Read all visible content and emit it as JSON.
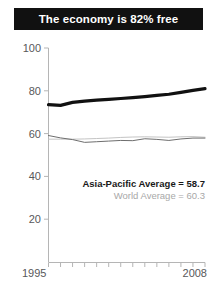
{
  "title": "The economy is 82% free",
  "chart_data": {
    "type": "line",
    "title": "The economy is 82% free",
    "xlabel": "",
    "ylabel": "",
    "xlim": [
      1995,
      2008
    ],
    "ylim": [
      0,
      100
    ],
    "yticks": [
      20,
      40,
      60,
      80,
      100
    ],
    "ytick_labels": [
      "20",
      "40",
      "60",
      "80",
      "100"
    ],
    "xticks": [
      1995,
      1996,
      1997,
      1998,
      1999,
      2000,
      2001,
      2002,
      2003,
      2004,
      2005,
      2006,
      2007,
      2008
    ],
    "xtick_labels_shown": [
      "1995",
      "2008"
    ],
    "grid": false,
    "legend": "annotation",
    "x": [
      1995,
      1996,
      1997,
      1998,
      1999,
      2000,
      2001,
      2002,
      2003,
      2004,
      2005,
      2006,
      2007,
      2008
    ],
    "series": [
      {
        "name": "Economy score",
        "color": "#111111",
        "width": 3.2,
        "values": [
          73.5,
          73.2,
          74.6,
          75.2,
          75.6,
          76.0,
          76.4,
          76.8,
          77.3,
          77.9,
          78.4,
          79.3,
          80.2,
          81.0
        ]
      },
      {
        "name": "Asia-Pacific Average",
        "color": "#6e6e6e",
        "width": 1.0,
        "values": [
          59.1,
          58.0,
          57.2,
          55.9,
          56.2,
          56.5,
          56.8,
          56.7,
          57.6,
          57.3,
          56.8,
          57.5,
          57.9,
          57.9
        ]
      },
      {
        "name": "World Average",
        "color": "#c4c4c4",
        "width": 1.0,
        "values": [
          57.4,
          57.4,
          57.4,
          57.5,
          57.7,
          57.9,
          58.2,
          58.4,
          58.5,
          58.4,
          58.3,
          58.5,
          58.6,
          58.3
        ]
      }
    ],
    "annotations": [
      {
        "text": "Asia-Pacific Average = 58.7",
        "color": "#1a1a1a",
        "emphasis": "bold"
      },
      {
        "text": "World Average = 60.3",
        "color": "#a8a8a8",
        "emphasis": "normal"
      }
    ]
  },
  "axis": {
    "y_labels": [
      "100",
      "80",
      "60",
      "40",
      "20"
    ],
    "x_start_label": "1995",
    "x_end_label": "2008"
  },
  "annotations": {
    "asia_pacific": "Asia-Pacific Average = 58.7",
    "world": "World Average = 60.3"
  },
  "colors": {
    "banner_bg": "#111111",
    "banner_text": "#ffffff",
    "series_primary": "#111111",
    "series_asia": "#6e6e6e",
    "series_world": "#c4c4c4",
    "axis": "#b5b5b5",
    "tick_text": "#58585a"
  }
}
